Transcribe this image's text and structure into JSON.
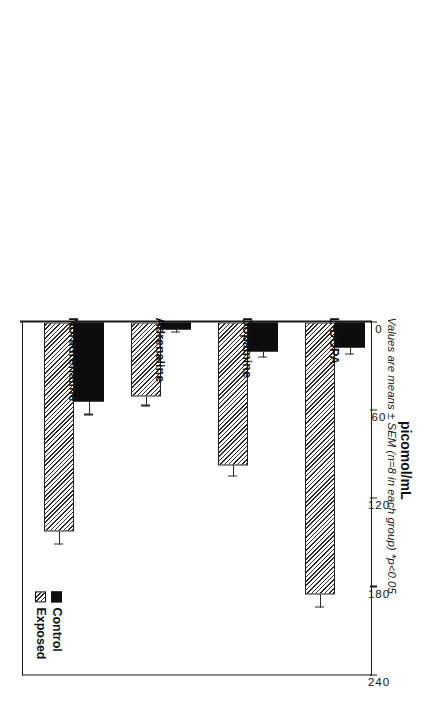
{
  "chart_data": {
    "type": "bar",
    "orientation": "horizontal",
    "title": "",
    "xlabel": "",
    "ylabel": "picomol/mL",
    "categories": [
      "Noradrenaline",
      "Adrenaline",
      "Dopamine",
      "L-DOPA"
    ],
    "series": [
      {
        "name": "Control",
        "values": [
          54,
          5,
          20,
          17
        ],
        "errors": [
          9,
          2,
          4,
          5
        ],
        "fill": "solid-black"
      },
      {
        "name": "Exposed",
        "values": [
          142,
          50,
          97,
          185
        ],
        "errors": [
          9,
          7,
          8,
          9
        ],
        "fill": "diagonal-hatch"
      }
    ],
    "value_axis": {
      "label": "picomol/mL",
      "ticks": [
        0,
        60,
        120,
        180,
        240
      ],
      "tick_labels": [
        "0",
        "60",
        "120",
        "180",
        "240"
      ],
      "limits": [
        0,
        240
      ]
    },
    "legend": {
      "position": "top-left-inside",
      "entries": [
        "Control",
        "Exposed"
      ]
    },
    "grid": false,
    "annotation": "Values are means ±  SEM (n=8 in each group)  *p<0.05"
  },
  "axis": {
    "title": "picomol/mL",
    "ticks": [
      {
        "label": "240",
        "value": 240
      },
      {
        "label": "180",
        "value": 180
      },
      {
        "label": "120",
        "value": 120
      },
      {
        "label": "60",
        "value": 60
      },
      {
        "label": "0",
        "value": 0
      }
    ]
  },
  "categories": [
    {
      "label": "Noradrenaline"
    },
    {
      "label": "Adrenaline"
    },
    {
      "label": "Dopamine"
    },
    {
      "label": "L-DOPA"
    }
  ],
  "legend": {
    "control_label": "Control",
    "exposed_label": "Exposed"
  },
  "caption": {
    "text": "Values are means ±  SEM (n=8 in each group)  *p<0.05"
  }
}
